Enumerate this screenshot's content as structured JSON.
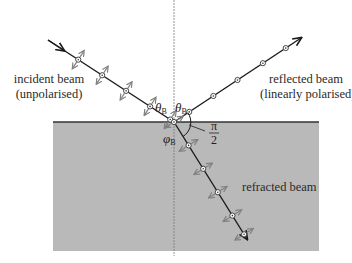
{
  "diagram": {
    "labels": {
      "incident_line1": "incident beam",
      "incident_line2": "(unpolarised)",
      "reflected_line1": "reflected beam",
      "reflected_line2": "(linearly polarised)",
      "refracted": "refracted beam",
      "theta_left": "θ",
      "theta_left_sub": "B",
      "theta_right": "θ",
      "theta_right_sub": "B",
      "phi": "φ",
      "phi_sub": "B",
      "right_angle_num": "π",
      "right_angle_den": "2"
    },
    "colors": {
      "medium": "#b9b9b9",
      "interface": "#333333",
      "beam": "#1a1a1a",
      "polarisation_arrows": "#808080",
      "normal": "#777777"
    },
    "geometry": {
      "interface_y": 122,
      "normal_x": 174,
      "medium_box": [
        53,
        122,
        319,
        251
      ]
    }
  }
}
